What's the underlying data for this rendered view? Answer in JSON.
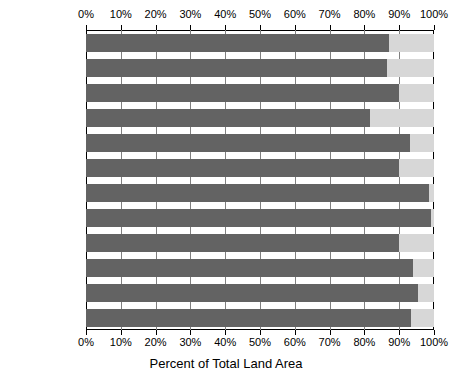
{
  "chart_data": {
    "type": "bar",
    "orientation": "horizontal",
    "title": "",
    "xlabel": "Percent of Total Land Area",
    "ylabel": "",
    "xlim": [
      0,
      100
    ],
    "grid": true,
    "legend": null,
    "tick_labels": [
      "0%",
      "10%",
      "20%",
      "30%",
      "40%",
      "50%",
      "60%",
      "70%",
      "80%",
      "90%",
      "100%"
    ],
    "tick_values": [
      0,
      10,
      20,
      30,
      40,
      50,
      60,
      70,
      80,
      90,
      100
    ],
    "categories": [
      "Ohio",
      "Indiana",
      "Illinois",
      "Michigan",
      "Wisconsin",
      "Minnesota",
      "Iowa",
      "Missouri",
      "North Dakota",
      "South Dakota",
      "Nebraska",
      "Kansas"
    ],
    "values": [
      87,
      86.5,
      90,
      81.5,
      93,
      90,
      98.5,
      99,
      90,
      94,
      95.5,
      93.5
    ],
    "series": [
      {
        "name": "Percent of Total Land Area",
        "values": [
          87,
          86.5,
          90,
          81.5,
          93,
          90,
          98.5,
          99,
          90,
          94,
          95.5,
          93.5
        ]
      }
    ]
  },
  "colors": {
    "bar": "#636363",
    "track": "#d7d7d7",
    "axis": "#000000",
    "gridline": "#808080",
    "background": "#ffffff"
  }
}
